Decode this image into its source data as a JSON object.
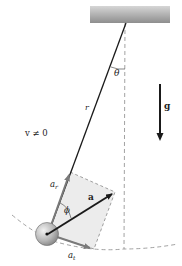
{
  "diagram": {
    "labels": {
      "theta": "θ",
      "r": "r",
      "g": "g",
      "velocity": "v ≠ 0",
      "a": "a",
      "phi": "ϕ",
      "a_r_base": "a",
      "a_r_sub": "r",
      "a_t_base": "a",
      "a_t_sub": "t"
    },
    "colors": {
      "ceiling_top": "#9a9a9a",
      "ceiling_bottom": "#c8c8c8",
      "string": "#1a1a1a",
      "dashed": "#888888",
      "component_arrow": "#7a7a7a",
      "accel_arrow": "#1a1a1a",
      "rect_fill": "#ececec",
      "bob_light": "#e6e6e6",
      "bob_dark": "#8a8a8a"
    }
  }
}
